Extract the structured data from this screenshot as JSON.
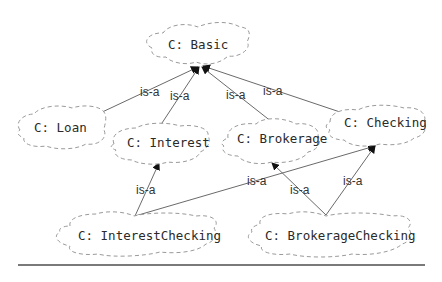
{
  "diagram": {
    "type": "class-hierarchy",
    "nodes": [
      {
        "id": "basic",
        "label": "C: Basic"
      },
      {
        "id": "loan",
        "label": "C: Loan"
      },
      {
        "id": "interest",
        "label": "C: Interest"
      },
      {
        "id": "brokerage",
        "label": "C: Brokerage"
      },
      {
        "id": "checking",
        "label": "C: Checking"
      },
      {
        "id": "interestchecking",
        "label": "C: InterestChecking"
      },
      {
        "id": "brokeragechecking",
        "label": "C: BrokerageChecking"
      }
    ],
    "edges": [
      {
        "from": "loan",
        "to": "basic",
        "label": "is-a"
      },
      {
        "from": "interest",
        "to": "basic",
        "label": "is-a"
      },
      {
        "from": "brokerage",
        "to": "basic",
        "label": "is-a"
      },
      {
        "from": "checking",
        "to": "basic",
        "label": "is-a"
      },
      {
        "from": "interestchecking",
        "to": "interest",
        "label": "is-a"
      },
      {
        "from": "interestchecking",
        "to": "checking",
        "label": "is-a"
      },
      {
        "from": "brokeragechecking",
        "to": "brokerage",
        "label": "is-a"
      },
      {
        "from": "brokeragechecking",
        "to": "checking",
        "label": "is-a"
      }
    ]
  }
}
